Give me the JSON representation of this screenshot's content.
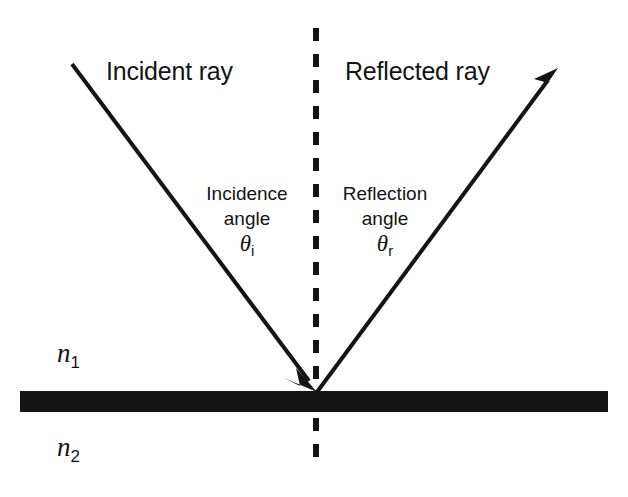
{
  "diagram": {
    "background_color": "#ffffff",
    "ink_color": "#141414",
    "labels": {
      "incident_ray": "Incident ray",
      "reflected_ray": "Reflected ray",
      "incidence_angle_line1": "Incidence",
      "incidence_angle_line2": "angle",
      "incidence_angle_symbol": "θ",
      "incidence_angle_subscript": "i",
      "reflection_angle_line1": "Reflection",
      "reflection_angle_line2": "angle",
      "reflection_angle_symbol": "θ",
      "reflection_angle_subscript": "r",
      "index_upper_symbol": "n",
      "index_upper_subscript": "1",
      "index_lower_symbol": "n",
      "index_lower_subscript": "2"
    },
    "geometry": {
      "incident_ray_start": [
        72,
        64
      ],
      "incident_ray_end": [
        317,
        392
      ],
      "reflected_ray_start": [
        317,
        392
      ],
      "reflected_ray_end": [
        558,
        68
      ],
      "normal_line_x": 316,
      "normal_line_top": 28,
      "normal_line_bottom": 470,
      "interface_left": 20,
      "interface_right": 608,
      "interface_top": 391,
      "interface_bottom": 412,
      "convergence_point": [
        317,
        392
      ]
    },
    "strokes": {
      "ray_width": 4,
      "normal_dash_width": 6,
      "normal_dash_pattern": "13 13",
      "interface_thickness": 21
    }
  }
}
